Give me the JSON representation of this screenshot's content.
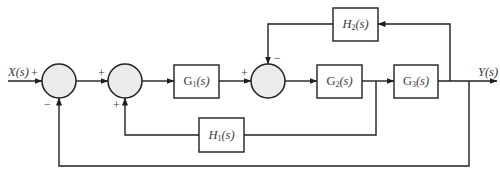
{
  "diagram": {
    "type": "control-system-block-diagram",
    "input_label": "X(s)",
    "output_label": "Y(s)",
    "blocks": {
      "g1": {
        "name": "G",
        "sub": "1",
        "arg": "(s)"
      },
      "g2": {
        "name": "G",
        "sub": "2",
        "arg": "(s)"
      },
      "g3": {
        "name": "G",
        "sub": "3",
        "arg": "(s)"
      },
      "h1": {
        "name": "H",
        "sub": "1",
        "arg": "(s)"
      },
      "h2": {
        "name": "H",
        "sub": "2",
        "arg": "(s)"
      }
    },
    "junctions": {
      "sum1": {
        "input_sign": "+",
        "feedback_sign": "−"
      },
      "sum2": {
        "input_sign": "+",
        "feedback_sign": "+"
      },
      "sum3": {
        "input_sign": "+",
        "feedback_sign": "−"
      }
    },
    "colors": {
      "line": "#231f20",
      "junction_fill": "#ebebeb",
      "block_fill": "#ffffff"
    }
  }
}
